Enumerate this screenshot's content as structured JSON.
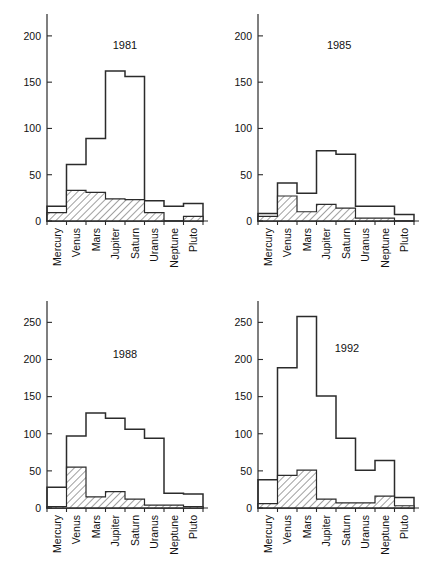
{
  "figure": {
    "categories": [
      "Mercury",
      "Venus",
      "Mars",
      "Jupiter",
      "Saturn",
      "Uranus",
      "Neptune",
      "Pluto"
    ],
    "series_names": [
      "total",
      "hatched"
    ],
    "line_color": "#2b2b2b",
    "fill_color": "#ffffff",
    "hatch_color": "#2b2b2b"
  },
  "chart_data": [
    {
      "type": "bar",
      "title": "1981",
      "xlabel": "",
      "ylabel": "",
      "ylim": [
        0,
        215
      ],
      "yticks": [
        0,
        50,
        100,
        150,
        200
      ],
      "ytick_labels": [
        "0",
        "50",
        "100",
        "150",
        "200"
      ],
      "grid": false,
      "legend": "none",
      "categories": [
        "Mercury",
        "Venus",
        "Mars",
        "Jupiter",
        "Saturn",
        "Uranus",
        "Neptune",
        "Pluto"
      ],
      "series": [
        {
          "name": "total",
          "values": [
            16,
            61,
            89,
            162,
            156,
            22,
            16,
            19
          ]
        },
        {
          "name": "hatched",
          "values": [
            9,
            33,
            31,
            24,
            23,
            9,
            0,
            5
          ]
        }
      ]
    },
    {
      "type": "bar",
      "title": "1985",
      "xlabel": "",
      "ylabel": "",
      "ylim": [
        0,
        215
      ],
      "yticks": [
        0,
        50,
        100,
        150,
        200
      ],
      "ytick_labels": [
        "0",
        "50",
        "100",
        "150",
        "200"
      ],
      "grid": false,
      "legend": "none",
      "categories": [
        "Mercury",
        "Venus",
        "Mars",
        "Jupiter",
        "Saturn",
        "Uranus",
        "Neptune",
        "Pluto"
      ],
      "series": [
        {
          "name": "total",
          "values": [
            8,
            41,
            30,
            76,
            72,
            16,
            16,
            7
          ]
        },
        {
          "name": "hatched",
          "values": [
            5,
            27,
            10,
            18,
            14,
            3,
            3,
            0
          ]
        }
      ]
    },
    {
      "type": "bar",
      "title": "1988",
      "xlabel": "",
      "ylabel": "",
      "ylim": [
        0,
        268
      ],
      "yticks": [
        0,
        50,
        100,
        150,
        200,
        250
      ],
      "ytick_labels": [
        "0",
        "50",
        "100",
        "150",
        "200",
        "250"
      ],
      "grid": false,
      "legend": "none",
      "categories": [
        "Mercury",
        "Venus",
        "Mars",
        "Jupiter",
        "Saturn",
        "Uranus",
        "Neptune",
        "Pluto"
      ],
      "series": [
        {
          "name": "total",
          "values": [
            28,
            97,
            128,
            121,
            106,
            94,
            20,
            19
          ]
        },
        {
          "name": "hatched",
          "values": [
            2,
            55,
            15,
            22,
            12,
            4,
            4,
            2
          ]
        }
      ]
    },
    {
      "type": "bar",
      "title": "1992",
      "xlabel": "",
      "ylabel": "",
      "ylim": [
        0,
        268
      ],
      "yticks": [
        0,
        50,
        100,
        150,
        200,
        250
      ],
      "ytick_labels": [
        "0",
        "50",
        "100",
        "150",
        "200",
        "250"
      ],
      "grid": false,
      "legend": "none",
      "categories": [
        "Mercury",
        "Venus",
        "Mars",
        "Jupiter",
        "Saturn",
        "Uranus",
        "Neptune",
        "Pluto"
      ],
      "series": [
        {
          "name": "total",
          "values": [
            38,
            189,
            258,
            151,
            94,
            51,
            64,
            14
          ]
        },
        {
          "name": "hatched",
          "values": [
            6,
            44,
            51,
            12,
            7,
            7,
            16,
            3
          ]
        }
      ]
    }
  ]
}
